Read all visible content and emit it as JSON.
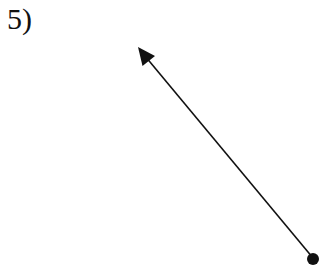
{
  "problem": {
    "number_label": "5)"
  },
  "figure": {
    "type": "ray",
    "endpoint": {
      "x": 313,
      "y": 258
    },
    "arrow_tip": {
      "x": 138,
      "y": 47
    },
    "color": "#111111"
  }
}
